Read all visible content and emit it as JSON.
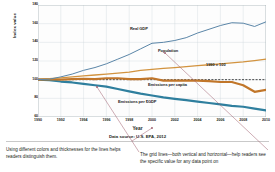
{
  "figure": {
    "source_note": "Data source: U.S. EPA, 2012",
    "axis": {
      "ytitle": "Index value",
      "xtitle": "Year"
    }
  },
  "captions": {
    "left": "Using different colors and thicknesses for the lines helps readers distinguish them.",
    "right": "The grid lines—both vertical and horizontal—help readers see the specific value for any data point on"
  },
  "annotations": {
    "reference_label": "1990 = 100"
  },
  "chart_data": {
    "type": "line",
    "title": "",
    "subtitle": "",
    "xlabel": "Year",
    "ylabel": "Index value",
    "xlim": [
      1990,
      2010
    ],
    "ylim": [
      60,
      180
    ],
    "yticks": [
      60,
      80,
      100,
      120,
      140,
      160,
      180
    ],
    "ytick_labels": [
      "60",
      "80",
      "100",
      "120",
      "140",
      "160",
      "180"
    ],
    "xticks": [
      1990,
      1992,
      1994,
      1996,
      1998,
      2000,
      2002,
      2004,
      2006,
      2008,
      2010
    ],
    "xtick_labels": [
      "1990",
      "1992",
      "1994",
      "1996",
      "1998",
      "2000",
      "2002",
      "2004",
      "2006",
      "2008",
      "2010"
    ],
    "grid": true,
    "legend": "inline-labels",
    "reference_line": {
      "value": 100,
      "label": "1990 = 100",
      "style": "dashed"
    },
    "x": [
      1990,
      1991,
      1992,
      1993,
      1994,
      1995,
      1996,
      1997,
      1998,
      1999,
      2000,
      2001,
      2002,
      2003,
      2004,
      2005,
      2006,
      2007,
      2008,
      2009,
      2010
    ],
    "series": [
      {
        "name": "Real GDP",
        "color": "#5b86a8",
        "width": 1.0,
        "values": [
          100,
          100.5,
          103,
          106,
          110,
          113,
          117,
          122,
          127,
          133,
          139,
          140,
          142,
          145,
          150,
          154,
          158,
          161,
          160.5,
          157,
          162
        ]
      },
      {
        "name": "Population",
        "color": "#d2933f",
        "width": 1.3,
        "values": [
          100,
          101,
          102,
          103,
          104,
          105,
          106,
          107,
          108,
          110,
          111,
          112,
          113,
          114,
          115,
          116,
          117,
          118,
          119,
          120.5,
          122
        ]
      },
      {
        "name": "Emissions per capita",
        "color": "#c1762a",
        "width": 2.2,
        "values": [
          100,
          100.5,
          100,
          100.5,
          101,
          100.5,
          101.5,
          101.5,
          100.5,
          100.5,
          101.5,
          99,
          99,
          99,
          99,
          98.5,
          97.5,
          97.5,
          94,
          87,
          89
        ]
      },
      {
        "name": "Emissions per $GDP",
        "color": "#2f7f9e",
        "width": 2.2,
        "values": [
          100,
          99.5,
          98,
          97,
          95.5,
          94,
          92.5,
          90,
          87.5,
          85,
          83,
          81,
          79.5,
          78,
          76.5,
          75,
          73.5,
          72,
          71,
          69,
          67
        ]
      }
    ]
  }
}
